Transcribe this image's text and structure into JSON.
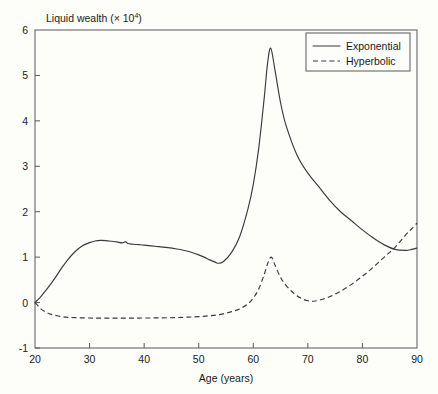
{
  "chart_data": {
    "type": "line",
    "title": "",
    "ylabel": "Liquid wealth (× 10",
    "ylabel_sup": "4",
    "ylabel_tail": ")",
    "xlabel": "Age (years)",
    "xlim": [
      20,
      90
    ],
    "ylim": [
      -1,
      6
    ],
    "xticks": [
      20,
      30,
      40,
      50,
      60,
      70,
      80,
      90
    ],
    "xtick_labels": [
      "20",
      "30",
      "40",
      "50",
      "60",
      "70",
      "80",
      "90"
    ],
    "yticks": [
      -1,
      0,
      1,
      2,
      3,
      4,
      5,
      6
    ],
    "ytick_labels": [
      "-1",
      "0",
      "1",
      "2",
      "3",
      "4",
      "5",
      "6"
    ],
    "grid": false,
    "legend_position": "top-right",
    "axis_color": "#585858",
    "line_color": "#3a3a3a",
    "background_color": "#fdfdfa",
    "legend": [
      {
        "name": "Exponential",
        "style": "solid"
      },
      {
        "name": "Hyperbolic",
        "style": "dashed"
      }
    ],
    "series": [
      {
        "name": "Exponential",
        "style": "solid",
        "x": [
          20,
          21,
          22,
          23,
          24,
          25,
          26,
          27,
          28,
          29,
          30,
          31,
          32,
          33,
          34,
          35,
          36,
          36.6,
          37,
          38,
          39,
          40,
          42,
          44,
          46,
          48,
          50,
          51,
          52,
          53,
          53.6,
          54.5,
          56,
          57.5,
          59,
          60,
          61,
          62,
          62.6,
          63.2,
          64,
          65,
          66,
          68,
          70,
          72,
          74,
          76,
          78,
          80,
          82,
          84,
          86,
          88,
          89,
          90
        ],
        "y": [
          0.0,
          0.12,
          0.27,
          0.43,
          0.6,
          0.78,
          0.94,
          1.08,
          1.19,
          1.27,
          1.32,
          1.355,
          1.37,
          1.365,
          1.35,
          1.335,
          1.315,
          1.34,
          1.3,
          1.285,
          1.275,
          1.265,
          1.24,
          1.215,
          1.18,
          1.13,
          1.05,
          1.0,
          0.94,
          0.89,
          0.865,
          0.9,
          1.1,
          1.45,
          2.05,
          2.6,
          3.4,
          4.5,
          5.25,
          5.6,
          5.1,
          4.4,
          3.9,
          3.25,
          2.85,
          2.55,
          2.25,
          2.0,
          1.8,
          1.6,
          1.42,
          1.27,
          1.17,
          1.15,
          1.17,
          1.2
        ]
      },
      {
        "name": "Hyperbolic",
        "style": "dashed",
        "x": [
          20,
          21,
          22,
          23,
          24,
          25,
          26,
          28,
          30,
          32,
          34,
          36,
          38,
          40,
          42,
          44,
          46,
          48,
          50,
          52,
          54,
          56,
          57.5,
          59,
          60,
          61,
          62,
          62.7,
          63.3,
          64,
          65,
          66,
          67,
          68,
          69,
          70,
          71,
          72,
          74,
          76,
          78,
          80,
          82,
          84,
          86,
          88,
          89,
          90
        ],
        "y": [
          0.0,
          -0.13,
          -0.21,
          -0.26,
          -0.29,
          -0.31,
          -0.325,
          -0.335,
          -0.34,
          -0.342,
          -0.343,
          -0.343,
          -0.342,
          -0.34,
          -0.338,
          -0.335,
          -0.33,
          -0.32,
          -0.31,
          -0.29,
          -0.26,
          -0.2,
          -0.14,
          -0.03,
          0.1,
          0.3,
          0.62,
          0.88,
          1.0,
          0.82,
          0.55,
          0.38,
          0.25,
          0.15,
          0.08,
          0.04,
          0.03,
          0.05,
          0.13,
          0.25,
          0.4,
          0.58,
          0.78,
          1.0,
          1.22,
          1.5,
          1.62,
          1.75
        ]
      }
    ]
  }
}
